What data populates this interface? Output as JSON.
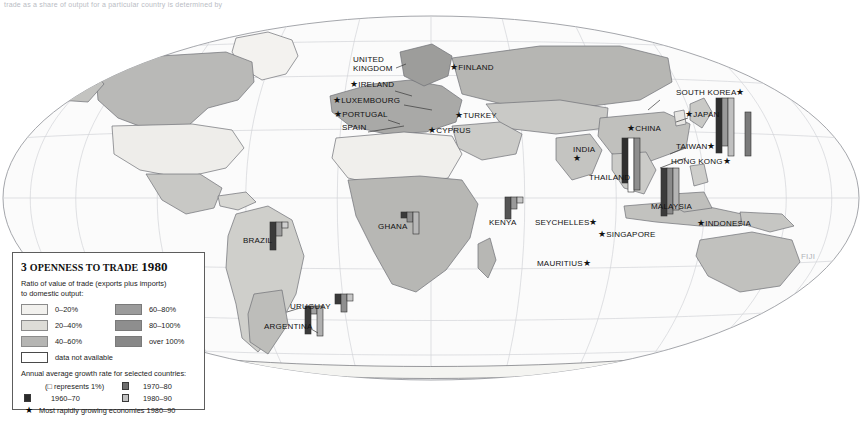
{
  "page": {
    "width": 863,
    "height": 424,
    "background": "#ffffff",
    "top_caption": "trade as a share of output for a particular country is determined by"
  },
  "legend": {
    "number": "3",
    "title_main": "OPENNESS TO TRADE",
    "title_year": "1980",
    "subtitle_line1": "Ratio of value of trade (exports plus imports)",
    "subtitle_line2": "to domestic output:",
    "swatches": [
      {
        "label": "0–20%",
        "color": "#f2f1ee",
        "border": "#8b8b8b"
      },
      {
        "label": "60–80%",
        "color": "#9b9b9b",
        "border": "#7a7a7a"
      },
      {
        "label": "20–40%",
        "color": "#dddcd7",
        "border": "#8b8b8b"
      },
      {
        "label": "80–100%",
        "color": "#8e8e8e",
        "border": "#7a7a7a"
      },
      {
        "label": "40–60%",
        "color": "#b5b5b3",
        "border": "#8b8b8b"
      },
      {
        "label": "over 100%",
        "color": "#888888",
        "border": "#7a7a7a"
      },
      {
        "label": "data not available",
        "color": "#ffffff",
        "border": "#4a4a4a"
      }
    ],
    "growth_heading": "Annual average growth rate for selected countries:",
    "growth_items": [
      {
        "label": "(□      represents 1%)",
        "swatch": "#ffffff",
        "kind": "note"
      },
      {
        "label": "1970–80",
        "swatch": "#6e6e6e",
        "kind": "bar"
      },
      {
        "label": "1960–70",
        "swatch": "#2b2b2b",
        "kind": "bar"
      },
      {
        "label": "1980–90",
        "swatch": "#c2c2c2",
        "kind": "bar"
      }
    ],
    "star_note": "Most rapidly growing economies 1980–90",
    "star_glyph": "★"
  },
  "map": {
    "projection": "oval world map",
    "graticule_color": "#c9cbd0",
    "coast_color": "#6e7076",
    "labels": [
      {
        "name": "united-kingdom",
        "text": "UNITED\nKINGDOM",
        "x": 353,
        "y": 55,
        "star": false
      },
      {
        "name": "ireland",
        "text": "IRELAND",
        "x": 350,
        "y": 80,
        "star": true,
        "star_side": "left"
      },
      {
        "name": "finland",
        "text": "FINLAND",
        "x": 450,
        "y": 63,
        "star": true,
        "star_side": "left"
      },
      {
        "name": "luxembourg",
        "text": "LUXEMBOURG",
        "x": 333,
        "y": 96,
        "star": true,
        "star_side": "left"
      },
      {
        "name": "portugal",
        "text": "PORTUGAL",
        "x": 334,
        "y": 110,
        "star": true,
        "star_side": "left"
      },
      {
        "name": "spain",
        "text": "SPAIN",
        "x": 342,
        "y": 123,
        "star": false
      },
      {
        "name": "turkey",
        "text": "TURKEY",
        "x": 455,
        "y": 111,
        "star": true,
        "star_side": "left"
      },
      {
        "name": "cyprus",
        "text": "CYPRUS",
        "x": 428,
        "y": 126,
        "star": true,
        "star_side": "left"
      },
      {
        "name": "south-korea",
        "text": "SOUTH KOREA",
        "x": 676,
        "y": 88,
        "star": true,
        "star_side": "right"
      },
      {
        "name": "japan",
        "text": "JAPAN",
        "x": 685,
        "y": 110,
        "star": true,
        "star_side": "left"
      },
      {
        "name": "china",
        "text": "CHINA",
        "x": 627,
        "y": 124,
        "star": true,
        "star_side": "left"
      },
      {
        "name": "taiwan",
        "text": "TAIWAN",
        "x": 676,
        "y": 142,
        "star": true,
        "star_side": "right"
      },
      {
        "name": "hong-kong",
        "text": "HONG KONG",
        "x": 671,
        "y": 157,
        "star": true,
        "star_side": "right"
      },
      {
        "name": "india",
        "text": "INDIA",
        "x": 573,
        "y": 145,
        "star": true,
        "star_side": "below"
      },
      {
        "name": "thailand",
        "text": "THAILAND",
        "x": 589,
        "y": 173,
        "star": false
      },
      {
        "name": "malaysia",
        "text": "MALAYSIA",
        "x": 651,
        "y": 202,
        "star": false
      },
      {
        "name": "indonesia",
        "text": "INDONESIA",
        "x": 697,
        "y": 219,
        "star": true,
        "star_side": "left"
      },
      {
        "name": "singapore",
        "text": "SINGAPORE",
        "x": 598,
        "y": 230,
        "star": true,
        "star_side": "left"
      },
      {
        "name": "seychelles",
        "text": "SEYCHELLES",
        "x": 535,
        "y": 218,
        "star": true,
        "star_side": "right"
      },
      {
        "name": "kenya",
        "text": "KENYA",
        "x": 489,
        "y": 218,
        "star": false
      },
      {
        "name": "mauritius",
        "text": "MAURITIUS",
        "x": 537,
        "y": 259,
        "star": true,
        "star_side": "right"
      },
      {
        "name": "ghana",
        "text": "GHANA",
        "x": 378,
        "y": 222,
        "star": false
      },
      {
        "name": "brazil",
        "text": "BRAZIL",
        "x": 243,
        "y": 236,
        "star": false
      },
      {
        "name": "uruguay",
        "text": "URUGUAY",
        "x": 290,
        "y": 302,
        "star": false
      },
      {
        "name": "argentina",
        "text": "ARGENTINA",
        "x": 264,
        "y": 322,
        "star": false
      },
      {
        "name": "fiji",
        "text": "FIJI",
        "x": 801,
        "y": 252,
        "star": false,
        "faint": true
      }
    ],
    "bar_groups": [
      {
        "name": "brazil-bars",
        "x": 270,
        "y": 222,
        "bars": [
          {
            "h": 28,
            "c": "#3a3a3a"
          },
          {
            "h": 14,
            "c": "#9b9b9b"
          },
          {
            "h": 6,
            "c": "#cfcfcf"
          }
        ]
      },
      {
        "name": "ghana-bars",
        "x": 401,
        "y": 212,
        "bars": [
          {
            "h": 6,
            "c": "#3a3a3a"
          },
          {
            "h": 10,
            "c": "#8f8f8f"
          },
          {
            "h": 22,
            "c": "#b8b8b8"
          }
        ]
      },
      {
        "name": "uruguay-bars",
        "x": 335,
        "y": 294,
        "bars": [
          {
            "h": 10,
            "c": "#3a3a3a"
          },
          {
            "h": 18,
            "c": "#8f8f8f"
          },
          {
            "h": 7,
            "c": "#c6c6c6"
          }
        ]
      },
      {
        "name": "argentina-bars",
        "x": 305,
        "y": 306,
        "bars": [
          {
            "h": 28,
            "c": "#3a3a3a"
          },
          {
            "h": 8,
            "c": "#a0a0a0"
          },
          {
            "h": 30,
            "c": "#b0b0b0"
          }
        ]
      },
      {
        "name": "kenya-bars",
        "x": 505,
        "y": 197,
        "bars": [
          {
            "h": 22,
            "c": "#555555"
          },
          {
            "h": 12,
            "c": "#9a9a9a"
          },
          {
            "h": 6,
            "c": "#c6c6c6"
          }
        ]
      },
      {
        "name": "thailand-bars",
        "x": 622,
        "y": 138,
        "bars": [
          {
            "h": 45,
            "c": "#2f2f2f"
          },
          {
            "h": 54,
            "c": "#ffffff"
          },
          {
            "h": 52,
            "c": "#8f8f8f"
          }
        ]
      },
      {
        "name": "malaysia-bars",
        "x": 661,
        "y": 168,
        "bars": [
          {
            "h": 48,
            "c": "#3b3b3b"
          },
          {
            "h": 46,
            "c": "#8a8a8a"
          },
          {
            "h": 42,
            "c": "#b4b4b4"
          }
        ]
      },
      {
        "name": "hongkong-bars",
        "x": 716,
        "y": 98,
        "bars": [
          {
            "h": 55,
            "c": "#2f2f2f"
          },
          {
            "h": 48,
            "c": "#9a9a9a"
          },
          {
            "h": 58,
            "c": "#c0c0c0"
          }
        ]
      },
      {
        "name": "taiwan-bars",
        "x": 745,
        "y": 112,
        "bars": [
          {
            "h": 44,
            "c": "#7a7a7a"
          }
        ]
      }
    ]
  }
}
